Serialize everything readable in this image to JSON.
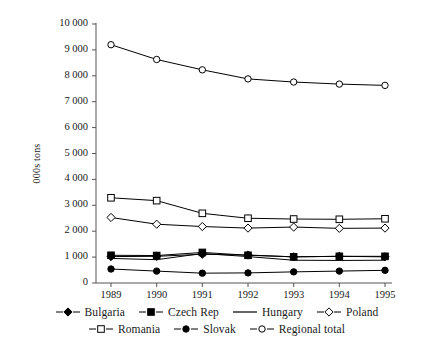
{
  "chart_data": {
    "type": "line",
    "title": "",
    "xlabel": "",
    "ylabel": "000s tons",
    "categories": [
      "1989",
      "1990",
      "1991",
      "1992",
      "1993",
      "1994",
      "1995"
    ],
    "x": [
      1989,
      1990,
      1991,
      1992,
      1993,
      1994,
      1995
    ],
    "ylim": [
      0,
      10000
    ],
    "yticks": [
      0,
      1000,
      2000,
      3000,
      4000,
      5000,
      6000,
      7000,
      8000,
      9000,
      10000
    ],
    "ytick_labels": [
      "0",
      "1 000",
      "2 000",
      "3 000",
      "4 000",
      "5 000",
      "6 000",
      "7 000",
      "8 000",
      "9 000",
      "10 000"
    ],
    "grid": false,
    "legend_position": "bottom",
    "series": [
      {
        "name": "Bulgaria",
        "marker": "filled-diamond",
        "color": "#000000",
        "values": [
          1020,
          1030,
          1110,
          1080,
          1010,
          1030,
          1010
        ]
      },
      {
        "name": "Czech Rep",
        "marker": "filled-square",
        "color": "#000000",
        "values": [
          1070,
          1060,
          1180,
          1070,
          1010,
          1030,
          1030
        ]
      },
      {
        "name": "Hungary",
        "marker": "none",
        "color": "#000000",
        "values": [
          950,
          900,
          1140,
          1020,
          880,
          870,
          880
        ]
      },
      {
        "name": "Poland",
        "marker": "open-diamond",
        "color": "#000000",
        "values": [
          2530,
          2270,
          2180,
          2120,
          2160,
          2110,
          2120
        ]
      },
      {
        "name": "Romania",
        "marker": "open-square",
        "color": "#000000",
        "values": [
          3290,
          3180,
          2690,
          2500,
          2470,
          2460,
          2480
        ]
      },
      {
        "name": "Slovak",
        "marker": "filled-circle",
        "color": "#000000",
        "values": [
          540,
          460,
          380,
          390,
          430,
          460,
          490
        ]
      },
      {
        "name": "Regional total",
        "marker": "open-circle",
        "color": "#000000",
        "values": [
          9200,
          8630,
          8230,
          7880,
          7760,
          7680,
          7630
        ]
      }
    ]
  },
  "axis": {
    "y_title": "000s tons"
  },
  "legend": {
    "rows": [
      [
        "Bulgaria",
        "Czech Rep",
        "Hungary",
        "Poland"
      ],
      [
        "Romania",
        "Slovak",
        "Regional total"
      ]
    ]
  }
}
